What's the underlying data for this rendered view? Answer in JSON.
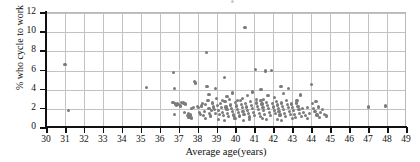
{
  "chart_data": {
    "type": "scatter",
    "title": "",
    "xlabel": "Average age(years)",
    "ylabel": "% who cycle to work",
    "xlim": [
      30,
      49
    ],
    "ylim": [
      0,
      12
    ],
    "xticks": [
      30,
      31,
      32,
      33,
      34,
      35,
      36,
      37,
      38,
      39,
      40,
      41,
      42,
      43,
      44,
      45,
      46,
      47,
      48,
      49
    ],
    "yticks": [
      0,
      2,
      4,
      6,
      8,
      10,
      12
    ],
    "grid": true,
    "legend": "none",
    "marker_color": "#7b7b7b",
    "grid_color": "#c2c2c2",
    "axis_color": "#111111",
    "background": "#ffffff",
    "points": [
      [
        31.0,
        6.6
      ],
      [
        31.2,
        1.8
      ],
      [
        35.3,
        4.2
      ],
      [
        36.75,
        5.8
      ],
      [
        36.8,
        4.1
      ],
      [
        36.7,
        2.7
      ],
      [
        36.85,
        2.5
      ],
      [
        36.95,
        2.55
      ],
      [
        36.9,
        2.35
      ],
      [
        37.0,
        2.45
      ],
      [
        36.8,
        1.4
      ],
      [
        37.1,
        2.3
      ],
      [
        37.25,
        2.6
      ],
      [
        37.3,
        1.6
      ],
      [
        37.45,
        1.3
      ],
      [
        37.5,
        1.5
      ],
      [
        37.55,
        1.15
      ],
      [
        37.6,
        1.35
      ],
      [
        37.7,
        2.0
      ],
      [
        37.8,
        2.1
      ],
      [
        37.85,
        4.85
      ],
      [
        37.9,
        4.7
      ],
      [
        38.0,
        2.25
      ],
      [
        38.05,
        2.15
      ],
      [
        38.1,
        1.6
      ],
      [
        38.15,
        1.45
      ],
      [
        38.2,
        2.3
      ],
      [
        38.3,
        1.3
      ],
      [
        38.35,
        1.75
      ],
      [
        38.4,
        2.45
      ],
      [
        38.45,
        7.9
      ],
      [
        38.5,
        4.35
      ],
      [
        38.55,
        2.85
      ],
      [
        38.6,
        2.05
      ],
      [
        38.65,
        1.55
      ],
      [
        38.7,
        1.25
      ],
      [
        38.8,
        2.6
      ],
      [
        38.85,
        2.2
      ],
      [
        38.9,
        1.95
      ],
      [
        38.95,
        1.5
      ],
      [
        39.0,
        3.05
      ],
      [
        39.05,
        2.35
      ],
      [
        39.1,
        1.85
      ],
      [
        39.15,
        1.45
      ],
      [
        39.2,
        2.55
      ],
      [
        39.25,
        2.1
      ],
      [
        39.3,
        1.65
      ],
      [
        39.35,
        1.3
      ],
      [
        39.4,
        5.3
      ],
      [
        39.45,
        2.75
      ],
      [
        39.5,
        2.2
      ],
      [
        39.55,
        1.9
      ],
      [
        39.6,
        1.55
      ],
      [
        39.65,
        1.2
      ],
      [
        39.7,
        2.95
      ],
      [
        39.75,
        2.4
      ],
      [
        39.8,
        2.05
      ],
      [
        39.85,
        1.7
      ],
      [
        39.9,
        1.35
      ],
      [
        39.95,
        1.05
      ],
      [
        40.0,
        2.65
      ],
      [
        40.05,
        2.3
      ],
      [
        40.1,
        1.95
      ],
      [
        40.15,
        1.6
      ],
      [
        40.2,
        1.25
      ],
      [
        40.25,
        2.85
      ],
      [
        40.3,
        2.45
      ],
      [
        40.35,
        2.1
      ],
      [
        40.4,
        1.75
      ],
      [
        40.45,
        1.4
      ],
      [
        40.5,
        10.5
      ],
      [
        40.55,
        2.55
      ],
      [
        40.6,
        2.2
      ],
      [
        40.65,
        1.85
      ],
      [
        40.7,
        1.5
      ],
      [
        40.75,
        1.15
      ],
      [
        40.8,
        2.75
      ],
      [
        40.85,
        2.35
      ],
      [
        40.9,
        2.0
      ],
      [
        40.95,
        1.65
      ],
      [
        41.0,
        1.3
      ],
      [
        41.05,
        6.1
      ],
      [
        41.1,
        2.6
      ],
      [
        41.15,
        2.25
      ],
      [
        41.2,
        1.9
      ],
      [
        41.25,
        1.55
      ],
      [
        41.3,
        1.2
      ],
      [
        41.35,
        2.9
      ],
      [
        41.4,
        2.5
      ],
      [
        41.45,
        2.15
      ],
      [
        41.5,
        1.8
      ],
      [
        41.55,
        1.45
      ],
      [
        41.6,
        5.95
      ],
      [
        41.65,
        2.7
      ],
      [
        41.7,
        2.35
      ],
      [
        41.75,
        2.0
      ],
      [
        41.8,
        1.65
      ],
      [
        41.85,
        1.3
      ],
      [
        41.9,
        6.0
      ],
      [
        41.95,
        2.55
      ],
      [
        42.0,
        2.2
      ],
      [
        42.05,
        1.85
      ],
      [
        42.1,
        1.5
      ],
      [
        42.15,
        2.8
      ],
      [
        42.2,
        2.4
      ],
      [
        42.25,
        2.05
      ],
      [
        42.3,
        1.7
      ],
      [
        42.35,
        1.35
      ],
      [
        42.4,
        4.35
      ],
      [
        42.45,
        2.6
      ],
      [
        42.5,
        2.25
      ],
      [
        42.55,
        1.9
      ],
      [
        42.6,
        1.55
      ],
      [
        42.65,
        1.2
      ],
      [
        42.7,
        2.85
      ],
      [
        42.75,
        2.45
      ],
      [
        42.8,
        2.1
      ],
      [
        42.85,
        1.75
      ],
      [
        42.9,
        1.4
      ],
      [
        42.95,
        2.5
      ],
      [
        43.0,
        2.15
      ],
      [
        43.05,
        1.8
      ],
      [
        43.1,
        1.45
      ],
      [
        43.15,
        1.1
      ],
      [
        43.2,
        2.6
      ],
      [
        43.3,
        2.25
      ],
      [
        43.35,
        1.9
      ],
      [
        43.4,
        1.55
      ],
      [
        43.5,
        1.2
      ],
      [
        43.55,
        2.0
      ],
      [
        43.6,
        1.6
      ],
      [
        43.7,
        1.3
      ],
      [
        43.8,
        2.1
      ],
      [
        43.9,
        1.5
      ],
      [
        44.0,
        4.5
      ],
      [
        44.05,
        2.55
      ],
      [
        44.1,
        2.05
      ],
      [
        44.2,
        1.7
      ],
      [
        44.3,
        1.35
      ],
      [
        44.4,
        2.2
      ],
      [
        44.5,
        1.6
      ],
      [
        44.6,
        1.9
      ],
      [
        44.7,
        1.45
      ],
      [
        44.8,
        1.25
      ],
      [
        47.0,
        2.2
      ],
      [
        47.9,
        2.3
      ],
      [
        37.15,
        2.65
      ],
      [
        37.35,
        2.5
      ],
      [
        38.25,
        2.55
      ],
      [
        38.75,
        1.85
      ],
      [
        39.3,
        2.9
      ],
      [
        40.12,
        2.9
      ],
      [
        40.38,
        3.1
      ],
      [
        41.12,
        3.0
      ],
      [
        41.48,
        2.95
      ],
      [
        42.08,
        3.2
      ],
      [
        43.25,
        2.9
      ],
      [
        44.25,
        2.75
      ],
      [
        39.55,
        3.3
      ],
      [
        40.62,
        3.35
      ],
      [
        41.72,
        3.4
      ],
      [
        38.6,
        3.5
      ],
      [
        42.55,
        3.6
      ],
      [
        43.45,
        3.45
      ],
      [
        40.9,
        3.75
      ],
      [
        39.85,
        3.65
      ],
      [
        41.35,
        4.05
      ],
      [
        38.95,
        4.15
      ],
      [
        42.8,
        4.1
      ],
      [
        37.68,
        1.05
      ],
      [
        38.42,
        0.95
      ],
      [
        39.12,
        0.85
      ],
      [
        40.02,
        0.95
      ],
      [
        40.72,
        0.9
      ],
      [
        41.42,
        1.0
      ],
      [
        42.22,
        0.9
      ],
      [
        43.02,
        1.0
      ],
      [
        43.82,
        0.95
      ],
      [
        44.42,
        1.1
      ],
      [
        39.42,
        0.75
      ],
      [
        40.42,
        0.8
      ],
      [
        41.62,
        0.85
      ],
      [
        42.42,
        0.8
      ]
    ]
  },
  "axes": {
    "y_title": "% who cycle to work",
    "x_title": "Average age(years)",
    "y_tick_labels": [
      "0",
      "2",
      "4",
      "6",
      "8",
      "10",
      "12"
    ],
    "x_tick_labels": [
      "30",
      "31",
      "32",
      "33",
      "34",
      "35",
      "36",
      "37",
      "38",
      "39",
      "40",
      "41",
      "42",
      "43",
      "44",
      "45",
      "46",
      "47",
      "48",
      "49"
    ]
  }
}
